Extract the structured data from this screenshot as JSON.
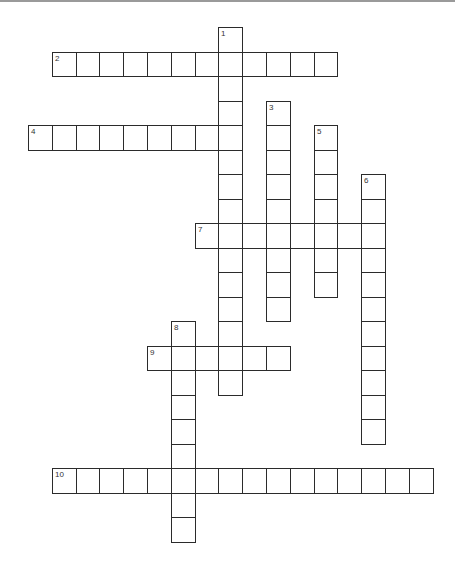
{
  "puzzle": {
    "type": "crossword",
    "layout": {
      "origin_x": 28,
      "origin_y": 27,
      "col_pitch": 23.8,
      "row_pitch": 24.5,
      "border_color": "#2b2b2b",
      "number_color": "#333333"
    },
    "entries": [
      {
        "number": "1",
        "direction": "down",
        "row": 0,
        "col": 8,
        "length": 15
      },
      {
        "number": "2",
        "direction": "across",
        "row": 1,
        "col": 1,
        "length": 12
      },
      {
        "number": "3",
        "direction": "down",
        "row": 3,
        "col": 10,
        "length": 9
      },
      {
        "number": "4",
        "direction": "across",
        "row": 4,
        "col": 0,
        "length": 9
      },
      {
        "number": "5",
        "direction": "down",
        "row": 4,
        "col": 12,
        "length": 7
      },
      {
        "number": "6",
        "direction": "down",
        "row": 6,
        "col": 14,
        "length": 11
      },
      {
        "number": "7",
        "direction": "across",
        "row": 8,
        "col": 7,
        "length": 8
      },
      {
        "number": "8",
        "direction": "down",
        "row": 12,
        "col": 6,
        "length": 9
      },
      {
        "number": "9",
        "direction": "across",
        "row": 13,
        "col": 5,
        "length": 6
      },
      {
        "number": "10",
        "direction": "across",
        "row": 18,
        "col": 1,
        "length": 16
      }
    ]
  }
}
